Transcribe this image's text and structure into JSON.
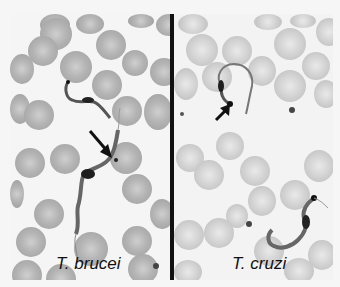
{
  "figure": {
    "panels": [
      {
        "id": "left",
        "caption": "T. brucei",
        "description": "Blood smear with trypomastigote of Trypanosoma brucei; arrow points to kinetoplast region",
        "cell_shade": "#a8a8a8"
      },
      {
        "id": "right",
        "caption": "T. cruzi",
        "description": "Blood smear with C-shaped trypomastigote of Trypanosoma cruzi; arrow points to large kinetoplast",
        "cell_shade": "#cfcfcf"
      }
    ],
    "colors": {
      "background": "#f5f5f5",
      "divider": "#111111",
      "parasite": "#2a2a2a",
      "arrow": "#111111"
    }
  }
}
